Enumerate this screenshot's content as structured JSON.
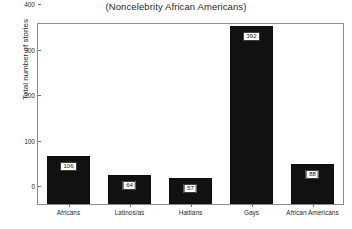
{
  "chart_data": {
    "type": "bar",
    "title": "(Noncelebrity African Americans)",
    "xlabel": "",
    "ylabel": "Total number of stories",
    "categories": [
      "Africans",
      "Latinos/as",
      "Haitians",
      "Gays",
      "African Americans"
    ],
    "values": [
      106,
      64,
      57,
      392,
      88
    ],
    "value_labels": [
      "106",
      "64",
      "57",
      "392",
      "88"
    ],
    "ylim": [
      0,
      400
    ],
    "yticks": [
      0,
      100,
      200,
      300,
      400
    ],
    "ytick_labels": [
      "0",
      "100",
      "200",
      "300",
      "400"
    ],
    "grid": false,
    "legend": null,
    "bar_color": "#111111",
    "background_color": "#ffffff",
    "axis_color": "#8c8c8c"
  }
}
